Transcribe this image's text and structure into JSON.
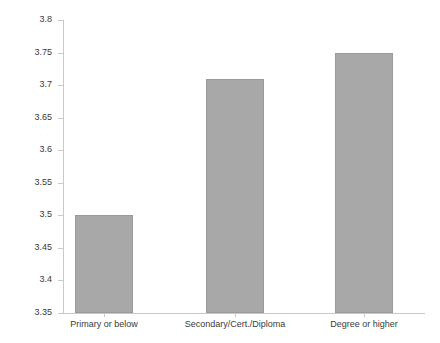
{
  "chart_data": {
    "type": "bar",
    "title": "",
    "subtitle": "",
    "xlabel": "",
    "ylabel": "",
    "categories": [
      "Primary or below",
      "Secondary/Cert./Diploma",
      "Degree or higher"
    ],
    "values": [
      3.5,
      3.71,
      3.75
    ],
    "ylim": [
      3.35,
      3.8
    ],
    "ytick_step": 0.05,
    "ytick_labels": [
      "3.8",
      "3.75",
      "3.7",
      "3.65",
      "3.6",
      "3.55",
      "3.5",
      "3.45",
      "3.4",
      "3.35"
    ],
    "ytick_values": [
      3.8,
      3.75,
      3.7,
      3.65,
      3.6,
      3.55,
      3.5,
      3.45,
      3.4,
      3.35
    ],
    "grid": false,
    "legend": null,
    "legend_position": "none",
    "series": [
      {
        "name": "",
        "values": [
          3.5,
          3.71,
          3.75
        ]
      }
    ],
    "colors": {
      "bar_fill": "#a8a8a8",
      "bar_border": "#9a9a9a",
      "axis_line": "#c9c9c9",
      "tick_text": "#3a3a3a",
      "background": "#ffffff"
    }
  }
}
